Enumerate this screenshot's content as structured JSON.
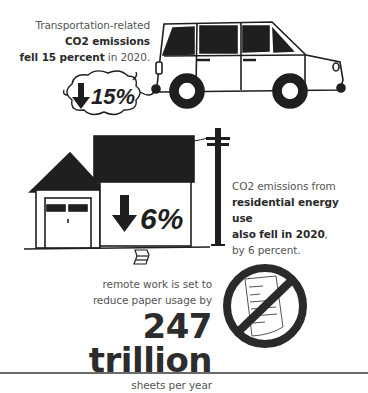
{
  "transportation": {
    "line1": "Transportation-related",
    "line2": "CO2 emissions",
    "line3_bold": "fell 15 percent",
    "line3_rest": " in 2020.",
    "badge": "15%",
    "badge_icon": "down-arrow-icon"
  },
  "residential": {
    "line1": "CO2 emissions from",
    "line2": "residential energy use",
    "line3_bold": "also fell in 2020",
    "line3_rest": ",",
    "line4": "by 6 percent.",
    "badge": "6%",
    "badge_icon": "down-arrow-icon"
  },
  "paper": {
    "line1": "remote work is set to",
    "line2": "reduce paper usage by",
    "big_value": "247 trillion",
    "line3": "sheets per year",
    "icon": "no-paper-icon"
  },
  "colors": {
    "ink": "#1f1f1f",
    "text": "#555555",
    "background": "#ffffff"
  }
}
